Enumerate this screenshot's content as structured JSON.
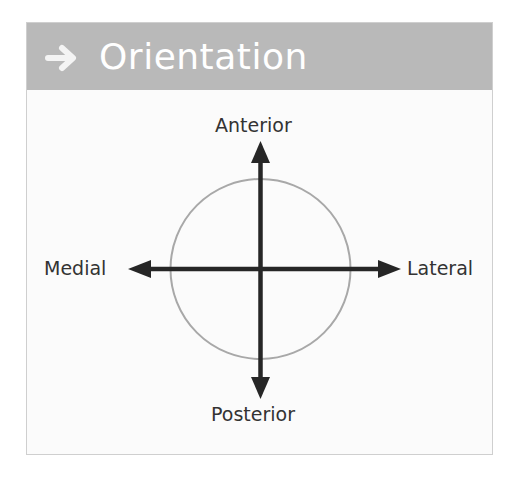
{
  "header": {
    "icon": "right-arrow-icon",
    "title": "Orientation"
  },
  "diagram": {
    "labels": {
      "anterior": "Anterior",
      "posterior": "Posterior",
      "medial": "Medial",
      "lateral": "Lateral"
    },
    "colors": {
      "header_bg": "#b9b9b9",
      "header_text": "#ffffff",
      "arrow": "#262626",
      "circle": "#a8a8a8",
      "label": "#333333",
      "panel_bg": "#fbfbfb",
      "panel_border": "#cfcfcf"
    }
  }
}
